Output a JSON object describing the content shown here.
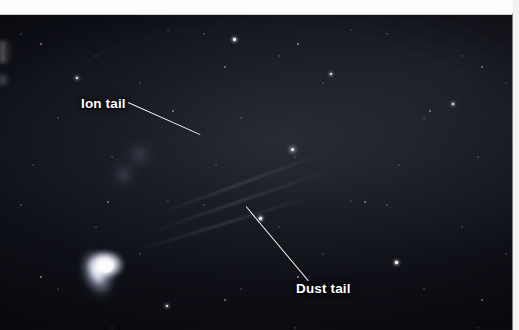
{
  "figure": {
    "media": "astronomical photograph",
    "background_color": "#05060a",
    "label_color": "#ffffff",
    "page_margin_color": "#fdfdfd"
  },
  "annotations": [
    {
      "id": "ion-tail",
      "label": "Ion tail",
      "leader_from": {
        "x": 128,
        "y": 102
      },
      "leader_to": {
        "x": 200,
        "y": 134
      },
      "label_pos": {
        "x": 81,
        "y": 96
      }
    },
    {
      "id": "dust-tail",
      "label": "Dust tail",
      "leader_from": {
        "x": 246,
        "y": 206
      },
      "leader_to": {
        "x": 308,
        "y": 280
      },
      "label_pos": {
        "x": 296,
        "y": 281
      }
    }
  ],
  "comet": {
    "nucleus": {
      "x": 105,
      "y": 251
    },
    "dust_tail_direction_deg": -19,
    "ion_tail_direction_deg": -13
  },
  "icons": {
    "leader_line": "pointer-line"
  }
}
